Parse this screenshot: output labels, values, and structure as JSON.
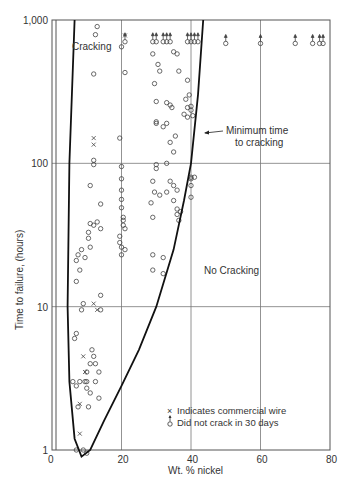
{
  "chart_data": {
    "type": "scatter",
    "title": "",
    "xlabel": "Wt. % nickel",
    "ylabel": "Time to failure, (hours)",
    "xlim": [
      0,
      80
    ],
    "ylim": [
      1,
      1000
    ],
    "yscale": "log",
    "x_ticks": [
      "0",
      "20",
      "40",
      "60",
      "80"
    ],
    "y_ticks": [
      "1",
      "10",
      "100",
      "1,000"
    ],
    "grid": true,
    "annotations": {
      "region_cracking": "Cracking",
      "region_no_cracking": "No Cracking",
      "curve_label_line1": "Minimum time",
      "curve_label_line2": "to cracking"
    },
    "legend": [
      {
        "symbol": "x",
        "label": "Indicates commercial wire"
      },
      {
        "symbol": "o-arrow",
        "label": "Did not crack in 30 days"
      }
    ],
    "series": [
      {
        "name": "Cracked specimens",
        "marker": "o",
        "points": [
          [
            13,
            900
          ],
          [
            12.5,
            790
          ],
          [
            12,
            420
          ],
          [
            12,
            105
          ],
          [
            12,
            98
          ],
          [
            11,
            70
          ],
          [
            14,
            52
          ],
          [
            11,
            38
          ],
          [
            12,
            37
          ],
          [
            13,
            39
          ],
          [
            14,
            35
          ],
          [
            10.5,
            33
          ],
          [
            10.5,
            30
          ],
          [
            11,
            26
          ],
          [
            8.5,
            25
          ],
          [
            7.5,
            23
          ],
          [
            9.5,
            22
          ],
          [
            7,
            21
          ],
          [
            8,
            18
          ],
          [
            7,
            15
          ],
          [
            14,
            12
          ],
          [
            9,
            10.5
          ],
          [
            8.5,
            9.5
          ],
          [
            14,
            9.5
          ],
          [
            7,
            6.5
          ],
          [
            6.5,
            6
          ],
          [
            11.5,
            5
          ],
          [
            12,
            4.5
          ],
          [
            11,
            4
          ],
          [
            12.5,
            4
          ],
          [
            13.5,
            3.5
          ],
          [
            10,
            3.5
          ],
          [
            8,
            3
          ],
          [
            9.5,
            3
          ],
          [
            10,
            3
          ],
          [
            12.5,
            3
          ],
          [
            6,
            3
          ],
          [
            7,
            2.8
          ],
          [
            10,
            2.7
          ],
          [
            11,
            2.5
          ],
          [
            13.5,
            2.3
          ],
          [
            7.5,
            2
          ],
          [
            10.5,
            2
          ],
          [
            7,
            1
          ],
          [
            9,
            1
          ],
          [
            10,
            0.95
          ],
          [
            20,
            95
          ],
          [
            20,
            78
          ],
          [
            20,
            65
          ],
          [
            20,
            56
          ],
          [
            20,
            49
          ],
          [
            20.5,
            42
          ],
          [
            20.5,
            40
          ],
          [
            20.5,
            37
          ],
          [
            21,
            35
          ],
          [
            19.5,
            31
          ],
          [
            19.5,
            28
          ],
          [
            20,
            26
          ],
          [
            21,
            25
          ],
          [
            20,
            23
          ],
          [
            20,
            650
          ],
          [
            21,
            430
          ],
          [
            19.5,
            150
          ],
          [
            30,
            98
          ],
          [
            30,
            92
          ],
          [
            29,
            75
          ],
          [
            29.5,
            63
          ],
          [
            31,
            60
          ],
          [
            28.5,
            53
          ],
          [
            29,
            42
          ],
          [
            29,
            23
          ],
          [
            32,
            22
          ],
          [
            29,
            18
          ],
          [
            32,
            17
          ],
          [
            29,
            580
          ],
          [
            30.5,
            490
          ],
          [
            31,
            440
          ],
          [
            29.5,
            360
          ],
          [
            30,
            270
          ],
          [
            33,
            265
          ],
          [
            34,
            255
          ],
          [
            34.5,
            245
          ],
          [
            33,
            190
          ],
          [
            32,
            180
          ],
          [
            35.5,
            155
          ],
          [
            34,
            140
          ],
          [
            35,
            120
          ],
          [
            33,
            100
          ],
          [
            34,
            75
          ],
          [
            35,
            70
          ],
          [
            36,
            65
          ],
          [
            33,
            63
          ],
          [
            35,
            55
          ],
          [
            30,
            190
          ],
          [
            30,
            195
          ],
          [
            35,
            600
          ],
          [
            36,
            580
          ],
          [
            36.5,
            440
          ],
          [
            39,
            380
          ],
          [
            39.5,
            300
          ],
          [
            38.5,
            280
          ],
          [
            40,
            250
          ],
          [
            39,
            245
          ],
          [
            40,
            235
          ],
          [
            38,
            220
          ],
          [
            39,
            210
          ],
          [
            40.5,
            215
          ],
          [
            40,
            80
          ],
          [
            40,
            78
          ],
          [
            41,
            80
          ],
          [
            40,
            70
          ],
          [
            40,
            58
          ],
          [
            36,
            48
          ],
          [
            37,
            46
          ],
          [
            36,
            44
          ],
          [
            36.5,
            40
          ]
        ]
      },
      {
        "name": "Commercial wire",
        "marker": "x",
        "points": [
          [
            12,
            150
          ],
          [
            12,
            135
          ],
          [
            12,
            10.5
          ],
          [
            13,
            9.5
          ],
          [
            9,
            4.5
          ],
          [
            9.5,
            3.5
          ],
          [
            8,
            2.1
          ],
          [
            8,
            1.3
          ],
          [
            21,
            780
          ]
        ]
      },
      {
        "name": "Did not crack in 30 days",
        "marker": "o-arrow",
        "points": [
          [
            21,
            740
          ],
          [
            29,
            740
          ],
          [
            30,
            740
          ],
          [
            32,
            740
          ],
          [
            33,
            740
          ],
          [
            34,
            740
          ],
          [
            39,
            740
          ],
          [
            40,
            740
          ],
          [
            41,
            740
          ],
          [
            42,
            740
          ],
          [
            50,
            720
          ],
          [
            60,
            720
          ],
          [
            70,
            720
          ],
          [
            75,
            720
          ],
          [
            77,
            720
          ],
          [
            78,
            720
          ]
        ]
      },
      {
        "name": "Minimum time to cracking (curve)",
        "marker": "line",
        "points": [
          [
            6.5,
            1000
          ],
          [
            5,
            100
          ],
          [
            4.5,
            10
          ],
          [
            5,
            3
          ],
          [
            6.5,
            1.2
          ],
          [
            8.5,
            0.9
          ],
          [
            11,
            1
          ],
          [
            15,
            1.6
          ],
          [
            20,
            2.8
          ],
          [
            25,
            5
          ],
          [
            30,
            10
          ],
          [
            35,
            25
          ],
          [
            38,
            55
          ],
          [
            40,
            100
          ],
          [
            42,
            300
          ],
          [
            43.5,
            1000
          ]
        ]
      }
    ]
  }
}
